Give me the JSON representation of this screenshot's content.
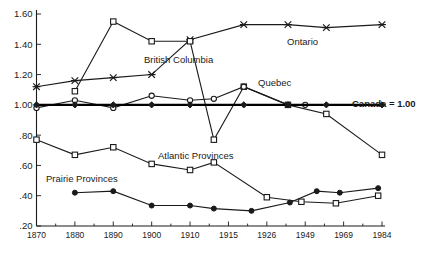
{
  "chart_data": {
    "type": "line",
    "title": "",
    "subtitle": "",
    "xlabel": "",
    "ylabel": "",
    "grid": false,
    "legend_position": "inline-annotations",
    "x": [
      "1870",
      "1880",
      "1890",
      "1900",
      "1910",
      "1915",
      "1926",
      "1949",
      "1969",
      "1984"
    ],
    "xtick_labels": [
      "1870",
      "1880",
      "1890",
      "1900",
      "1910",
      "1915",
      "1926",
      "1949",
      "1969",
      "1984"
    ],
    "ytick_labels": [
      "1.60",
      "1.40",
      "1.20",
      "1.00",
      ".80",
      ".60",
      ".40",
      ".20"
    ],
    "ytick_values": [
      1.6,
      1.4,
      1.2,
      1.0,
      0.8,
      0.6,
      0.4,
      0.2
    ],
    "ylim": [
      0.2,
      1.6
    ],
    "xlim": [
      0,
      9
    ],
    "reference_line": {
      "label": "Canada = 1.00",
      "value": 1.0
    },
    "series": [
      {
        "name": "Ontario",
        "marker": "star",
        "label_x": "1926",
        "values": [
          1.12,
          1.16,
          1.18,
          1.2,
          1.43,
          1.53,
          1.53,
          1.53,
          1.51,
          1.53
        ]
      },
      {
        "name": "British Columbia",
        "marker": "open-square",
        "label_x": "1910",
        "values": [
          null,
          1.09,
          1.55,
          1.42,
          1.42,
          0.84,
          1.12,
          1.0,
          0.94,
          0.67
        ]
      },
      {
        "name": "Quebec",
        "marker": "open-circle",
        "label_x": "1926",
        "values": [
          0.98,
          1.03,
          0.98,
          1.06,
          1.03,
          1.04,
          1.12,
          1.0,
          1.0,
          1.0
        ]
      },
      {
        "name": "Canada",
        "marker": "solid-diamond",
        "label_x": "1984",
        "values": [
          1.0,
          1.0,
          1.0,
          1.0,
          1.0,
          1.0,
          1.0,
          1.0,
          1.0,
          1.0
        ]
      },
      {
        "name": "Atlantic Provinces",
        "marker": "open-square",
        "label_x": "1926",
        "values": [
          0.77,
          0.67,
          0.72,
          0.61,
          0.57,
          0.62,
          0.39,
          0.36,
          0.35,
          0.4
        ]
      },
      {
        "name": "Prairie Provinces",
        "marker": "solid-circle",
        "label_x": "1890",
        "values": [
          null,
          0.42,
          0.43,
          0.33,
          0.33,
          0.31,
          0.3,
          0.36,
          0.42,
          0.45
        ]
      }
    ],
    "annotations": [
      {
        "text": "Ontario",
        "x": 1.49,
        "y": 1.545
      },
      {
        "text": "British Columbia",
        "x": 0.0,
        "y": 0.0
      },
      {
        "text": "Quebec",
        "x": 0.0,
        "y": 0.0
      },
      {
        "text": "Atlantic Provinces",
        "x": 0.0,
        "y": 0.0
      },
      {
        "text": "Prairie Provinces",
        "x": 0.0,
        "y": 0.0
      },
      {
        "text": "Canada = 1.00",
        "x": 0.0,
        "y": 0.0
      }
    ]
  },
  "labels": {
    "ontario": "Ontario",
    "british_columbia": "British Columbia",
    "quebec": "Quebec",
    "atlantic_provinces": "Atlantic Provinces",
    "prairie_provinces": "Prairie Provinces",
    "canada_reference": "Canada = 1.00"
  },
  "colors": {
    "ink": "#1a1a1a",
    "background": "#ffffff"
  }
}
